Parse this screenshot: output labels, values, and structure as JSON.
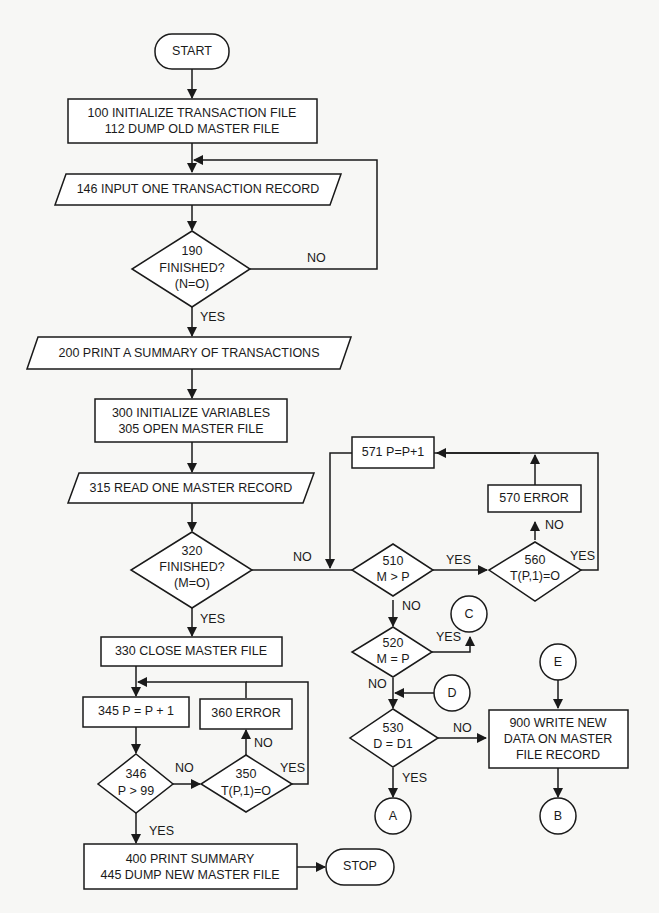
{
  "diagram": {
    "colors": {
      "stroke": "#1a1a1a",
      "fill": "#ffffff",
      "background": "#f7f7f5"
    },
    "nodes": {
      "start": {
        "type": "terminator",
        "label": "START"
      },
      "n100": {
        "type": "process",
        "lines": [
          "100 INITIALIZE TRANSACTION FILE",
          "112 DUMP OLD MASTER FILE"
        ]
      },
      "n146": {
        "type": "io",
        "label": "146 INPUT ONE TRANSACTION RECORD"
      },
      "n190": {
        "type": "decision",
        "lines": [
          "190",
          "FINISHED?",
          "(N=O)"
        ]
      },
      "n200": {
        "type": "io",
        "label": "200 PRINT A SUMMARY OF TRANSACTIONS"
      },
      "n300": {
        "type": "process",
        "lines": [
          "300 INITIALIZE VARIABLES",
          "305 OPEN MASTER FILE"
        ]
      },
      "n315": {
        "type": "io",
        "label": "315 READ ONE MASTER RECORD"
      },
      "n320": {
        "type": "decision",
        "lines": [
          "320",
          "FINISHED?",
          "(M=O)"
        ]
      },
      "n330": {
        "type": "process",
        "label": "330 CLOSE MASTER FILE"
      },
      "n345": {
        "type": "process",
        "label": "345 P = P + 1"
      },
      "n346": {
        "type": "decision",
        "lines": [
          "346",
          "P > 99"
        ]
      },
      "n350": {
        "type": "decision",
        "lines": [
          "350",
          "T(P,1)=O"
        ]
      },
      "n360": {
        "type": "process",
        "label": "360 ERROR"
      },
      "n400": {
        "type": "process",
        "lines": [
          "400 PRINT SUMMARY",
          "445 DUMP NEW MASTER FILE"
        ]
      },
      "stop": {
        "type": "terminator",
        "label": "STOP"
      },
      "n510": {
        "type": "decision",
        "lines": [
          "510",
          "M > P"
        ]
      },
      "n520": {
        "type": "decision",
        "lines": [
          "520",
          "M = P"
        ]
      },
      "n530": {
        "type": "decision",
        "lines": [
          "530",
          "D = D1"
        ]
      },
      "n560": {
        "type": "decision",
        "lines": [
          "560",
          "T(P,1)=O"
        ]
      },
      "n570": {
        "type": "process",
        "label": "570 ERROR"
      },
      "n571": {
        "type": "process",
        "label": "571 P=P+1"
      },
      "n900": {
        "type": "process",
        "lines": [
          "900 WRITE NEW",
          "DATA ON MASTER",
          "FILE RECORD"
        ]
      },
      "conn_a": {
        "type": "connector",
        "label": "A"
      },
      "conn_b": {
        "type": "connector",
        "label": "B"
      },
      "conn_c": {
        "type": "connector",
        "label": "C"
      },
      "conn_d": {
        "type": "connector",
        "label": "D"
      },
      "conn_e": {
        "type": "connector",
        "label": "E"
      }
    },
    "edge_labels": {
      "n190_no": "NO",
      "n190_yes": "YES",
      "n320_no": "NO",
      "n320_yes": "YES",
      "n346_no": "NO",
      "n346_yes": "YES",
      "n350_no": "NO",
      "n350_yes": "YES",
      "n510_yes": "YES",
      "n510_no": "NO",
      "n520_yes": "YES",
      "n520_no": "NO",
      "n530_no": "NO",
      "n530_yes": "YES",
      "n560_no": "NO",
      "n560_yes": "YES"
    }
  }
}
